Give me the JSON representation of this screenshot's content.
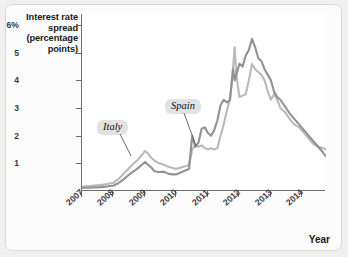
{
  "figure": {
    "background_color": "#f0f0ef",
    "plot_background_color": "#ffffff",
    "axis_color": "#6e6e6e"
  },
  "axes": {
    "ylabel_lines": [
      "Interest rate",
      "spread",
      "(percentage",
      "points)"
    ],
    "ylabel_text": "Interest rate spread (percentage points)",
    "xlabel": "Year",
    "ytick_labels": [
      "6%",
      "5",
      "4",
      "3",
      "2",
      "1"
    ],
    "ytick_values": [
      6,
      5,
      4,
      3,
      2,
      1
    ],
    "xtick_labels": [
      "2007",
      "2008",
      "2009",
      "2010",
      "2011",
      "2012",
      "2013",
      "2014"
    ],
    "xtick_values": [
      2007,
      2008,
      2009,
      2010,
      2011,
      2012,
      2013,
      2014
    ]
  },
  "callouts": {
    "italy": "Italy",
    "spain": "Spain"
  },
  "chart_data": {
    "type": "line",
    "title": "",
    "subtitle": "",
    "xlabel": "Year",
    "ylabel": "Interest rate spread (percentage points)",
    "xlim": [
      2007.0,
      2014.75
    ],
    "ylim": [
      0,
      6.4
    ],
    "grid": false,
    "legend_position": "inline-callouts",
    "xtick_labels": [
      "2007",
      "2008",
      "2009",
      "2010",
      "2011",
      "2012",
      "2013",
      "2014"
    ],
    "ytick_labels": [
      "6%",
      "5",
      "4",
      "3",
      "2",
      "1"
    ],
    "annotations": [
      {
        "text": "Italy",
        "points_to_series": "Italy",
        "at_x": 2009.05,
        "at_y": 1.1
      },
      {
        "text": "Spain",
        "points_to_series": "Spain",
        "at_x": 2010.95,
        "at_y": 1.95
      }
    ],
    "series": [
      {
        "name": "Italy",
        "color": "#b9bab5",
        "x": [
          2007.0,
          2007.2,
          2007.4,
          2007.6,
          2007.8,
          2008.0,
          2008.15,
          2008.3,
          2008.45,
          2008.6,
          2008.75,
          2008.9,
          2009.0,
          2009.1,
          2009.2,
          2009.3,
          2009.45,
          2009.6,
          2009.75,
          2009.9,
          2010.0,
          2010.15,
          2010.3,
          2010.4,
          2010.5,
          2010.6,
          2010.7,
          2010.8,
          2010.9,
          2011.0,
          2011.1,
          2011.2,
          2011.3,
          2011.4,
          2011.5,
          2011.6,
          2011.7,
          2011.8,
          2011.85,
          2011.9,
          2012.0,
          2012.1,
          2012.2,
          2012.3,
          2012.4,
          2012.5,
          2012.6,
          2012.7,
          2012.8,
          2012.9,
          2013.0,
          2013.1,
          2013.2,
          2013.3,
          2013.45,
          2013.6,
          2013.75,
          2013.9,
          2014.05,
          2014.2,
          2014.35,
          2014.5,
          2014.65,
          2014.75
        ],
        "y": [
          0.15,
          0.18,
          0.2,
          0.22,
          0.25,
          0.3,
          0.42,
          0.6,
          0.78,
          0.95,
          1.1,
          1.3,
          1.45,
          1.35,
          1.2,
          1.1,
          1.0,
          0.95,
          0.88,
          0.82,
          0.8,
          0.85,
          0.9,
          0.95,
          1.5,
          1.65,
          1.6,
          1.65,
          1.55,
          1.5,
          1.55,
          1.5,
          1.55,
          2.0,
          2.4,
          2.9,
          3.3,
          4.5,
          5.2,
          4.2,
          3.4,
          3.45,
          3.5,
          4.0,
          4.6,
          4.4,
          4.3,
          4.2,
          4.0,
          3.6,
          3.3,
          3.5,
          3.3,
          3.0,
          2.85,
          2.6,
          2.4,
          2.3,
          2.1,
          1.9,
          1.7,
          1.6,
          1.55,
          1.5
        ]
      },
      {
        "name": "Spain",
        "color": "#8f9290",
        "x": [
          2007.0,
          2007.2,
          2007.4,
          2007.6,
          2007.8,
          2008.0,
          2008.15,
          2008.3,
          2008.45,
          2008.6,
          2008.75,
          2008.9,
          2009.0,
          2009.1,
          2009.2,
          2009.3,
          2009.45,
          2009.6,
          2009.75,
          2009.9,
          2010.0,
          2010.15,
          2010.3,
          2010.4,
          2010.5,
          2010.6,
          2010.7,
          2010.8,
          2010.9,
          2011.0,
          2011.1,
          2011.2,
          2011.3,
          2011.4,
          2011.5,
          2011.6,
          2011.7,
          2011.8,
          2011.85,
          2011.9,
          2012.0,
          2012.1,
          2012.2,
          2012.3,
          2012.4,
          2012.5,
          2012.6,
          2012.7,
          2012.8,
          2012.9,
          2013.0,
          2013.1,
          2013.2,
          2013.3,
          2013.45,
          2013.6,
          2013.75,
          2013.9,
          2014.05,
          2014.2,
          2014.35,
          2014.5,
          2014.65,
          2014.75
        ],
        "y": [
          0.12,
          0.12,
          0.13,
          0.14,
          0.16,
          0.2,
          0.28,
          0.4,
          0.55,
          0.68,
          0.8,
          0.95,
          1.05,
          0.95,
          0.85,
          0.72,
          0.68,
          0.7,
          0.62,
          0.6,
          0.6,
          0.68,
          0.75,
          0.8,
          2.0,
          1.6,
          1.75,
          2.25,
          2.3,
          2.1,
          2.0,
          2.2,
          2.55,
          3.1,
          3.3,
          3.2,
          3.3,
          4.4,
          4.0,
          4.2,
          4.6,
          4.5,
          4.9,
          5.1,
          5.5,
          5.2,
          4.8,
          4.7,
          4.4,
          4.2,
          4.0,
          3.6,
          3.4,
          3.3,
          3.05,
          2.8,
          2.6,
          2.4,
          2.2,
          2.0,
          1.8,
          1.6,
          1.4,
          1.25
        ]
      }
    ]
  }
}
